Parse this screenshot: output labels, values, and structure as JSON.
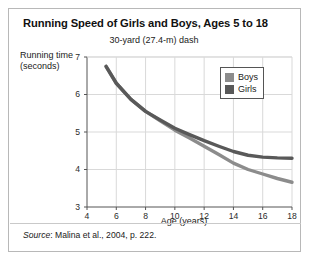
{
  "figure": {
    "title": "Running Speed of Girls and Boys, Ages 5 to 18",
    "subtitle": "30-yard (27.4-m) dash",
    "source_lead": "Source",
    "source_rest": ": Malina et al., 2004, p. 222."
  },
  "colors": {
    "boys_line": "#8c8c8c",
    "girls_line": "#595959",
    "grid": "#d9d9d9",
    "axis": "#555555",
    "frame": "#b8b8b8",
    "text": "#1a1a1a"
  },
  "chart_data": {
    "type": "line",
    "title": "Running Speed of Girls and Boys, Ages 5 to 18",
    "subtitle": "30-yard (27.4-m) dash",
    "xlabel": "Age (years)",
    "ylabel": "Running time (seconds)",
    "xlim": [
      4,
      18
    ],
    "ylim": [
      3,
      7
    ],
    "xticks": [
      4,
      6,
      8,
      10,
      12,
      14,
      16,
      18
    ],
    "xticklabels": [
      "4",
      "6",
      "8",
      "10",
      "12",
      "14",
      "16",
      "18"
    ],
    "yticks": [
      3,
      4,
      5,
      6,
      7
    ],
    "yticklabels": [
      "3",
      "4",
      "5",
      "6",
      "7"
    ],
    "grid": true,
    "legend_position": "top-right",
    "legend": [
      "Boys",
      "Girls"
    ],
    "x": [
      5.3,
      6,
      7,
      8,
      9,
      10,
      11,
      12,
      13,
      14,
      15,
      16,
      17,
      18
    ],
    "series": [
      {
        "name": "Boys",
        "color": "#8c8c8c",
        "values": [
          6.75,
          6.3,
          5.87,
          5.55,
          5.3,
          5.05,
          4.84,
          4.62,
          4.4,
          4.17,
          4.0,
          3.88,
          3.76,
          3.66
        ]
      },
      {
        "name": "Girls",
        "color": "#595959",
        "values": [
          6.75,
          6.3,
          5.87,
          5.55,
          5.32,
          5.1,
          4.93,
          4.77,
          4.62,
          4.48,
          4.38,
          4.33,
          4.31,
          4.3
        ]
      }
    ]
  }
}
